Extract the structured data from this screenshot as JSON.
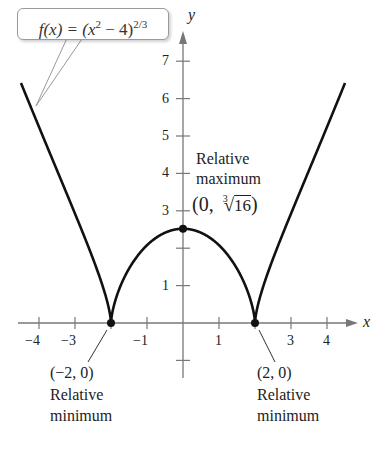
{
  "chart_data": {
    "type": "line",
    "function_label": {
      "prefix": "f(x) = (x",
      "sup1": "2",
      "mid": " − 4)",
      "sup2": "2/3"
    },
    "xlabel": "x",
    "ylabel": "y",
    "xlim": [
      -4.5,
      4.5
    ],
    "ylim": [
      -1.5,
      7.5
    ],
    "grid": false,
    "x_ticks": [
      -4,
      -3,
      -2,
      -1,
      1,
      2,
      3,
      4
    ],
    "x_tick_labels": [
      "−4",
      "−3",
      "",
      "−1",
      "1",
      "",
      "3",
      "4"
    ],
    "y_ticks": [
      -1,
      1,
      2,
      3,
      4,
      5,
      6,
      7
    ],
    "y_tick_labels": [
      "",
      "1",
      "",
      "3",
      "4",
      "5",
      "6",
      "7"
    ],
    "series": [
      {
        "name": "f(x) = (x^2 - 4)^(2/3)",
        "x": [
          -4.5,
          -4,
          -3.5,
          -3,
          -2.5,
          -2,
          -1.5,
          -1,
          -0.5,
          0,
          0.5,
          1,
          1.5,
          2,
          2.5,
          3,
          3.5,
          4,
          4.5
        ],
        "y": [
          6.56,
          5.24,
          4.04,
          2.92,
          1.72,
          0,
          1.46,
          2.08,
          2.41,
          2.52,
          2.41,
          2.08,
          1.46,
          0,
          1.72,
          2.92,
          4.04,
          5.24,
          6.56
        ]
      }
    ],
    "points": [
      {
        "x": -2,
        "y": 0,
        "label": "(−2, 0)",
        "note_line1": "Relative",
        "note_line2": "minimum"
      },
      {
        "x": 0,
        "y": 2.52,
        "label": "(0, ∛16)",
        "note_line1": "Relative",
        "note_line2": "maximum"
      },
      {
        "x": 2,
        "y": 0,
        "label": "(2, 0)",
        "note_line1": "Relative",
        "note_line2": "minimum"
      }
    ],
    "annotations": {
      "max_line1": "Relative",
      "max_line2": "maximum",
      "max_coord_open": "(0, ",
      "max_root_index": "3",
      "max_root_radicand": "16",
      "max_coord_close": ")",
      "min_left_coord": "(−2, 0)",
      "min_left_line1": "Relative",
      "min_left_line2": "minimum",
      "min_right_coord": "(2, 0)",
      "min_right_line1": "Relative",
      "min_right_line2": "minimum"
    },
    "colors": {
      "curve": "#111111",
      "axis": "#777777",
      "callout_border": "#9a9a9a"
    }
  }
}
